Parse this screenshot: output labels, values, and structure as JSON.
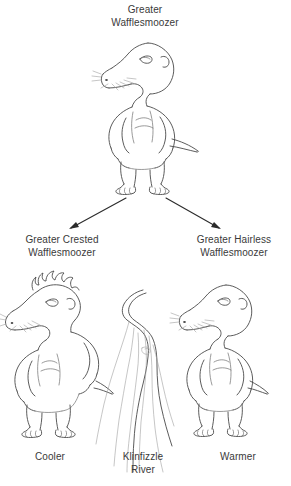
{
  "figure": {
    "type": "diagram",
    "subtype": "cladogram-speciation-illustration",
    "background_color": "#ffffff",
    "ink_color": "#4a4a4a",
    "text_color": "#3a3a3a",
    "arrow_color": "#2b2b2b"
  },
  "labels": {
    "root_species": "Greater\nWafflesmoozer",
    "left_species": "Greater Crested\nWafflesmoozer",
    "right_species": "Greater Hairless\nWafflesmoozer",
    "left_condition": "Cooler",
    "barrier": "Klinfizzle\nRiver",
    "right_condition": "Warmer"
  },
  "organisms": [
    {
      "name": "Greater Wafflesmoozer",
      "role": "ancestral-species",
      "position": "top-center",
      "traits": [
        "long snout",
        "whiskers",
        "round ear",
        "no crest",
        "short tail",
        "three-toed feet"
      ]
    },
    {
      "name": "Greater Crested Wafflesmoozer",
      "role": "descendant-species",
      "position": "bottom-left",
      "traits": [
        "spiky crest",
        "long snout",
        "whiskers",
        "short tail",
        "three-toed feet"
      ]
    },
    {
      "name": "Greater Hairless Wafflesmoozer",
      "role": "descendant-species",
      "position": "bottom-right",
      "traits": [
        "smooth head",
        "long snout",
        "whiskers",
        "short tail",
        "three-toed feet"
      ]
    }
  ],
  "barrier_feature": {
    "name": "Klinfizzle River",
    "type": "geographic-barrier",
    "position": "bottom-center"
  },
  "arrows": [
    {
      "from": "Greater Wafflesmoozer",
      "to": "Greater Crested Wafflesmoozer",
      "direction": "down-left"
    },
    {
      "from": "Greater Wafflesmoozer",
      "to": "Greater Hairless Wafflesmoozer",
      "direction": "down-right"
    }
  ]
}
